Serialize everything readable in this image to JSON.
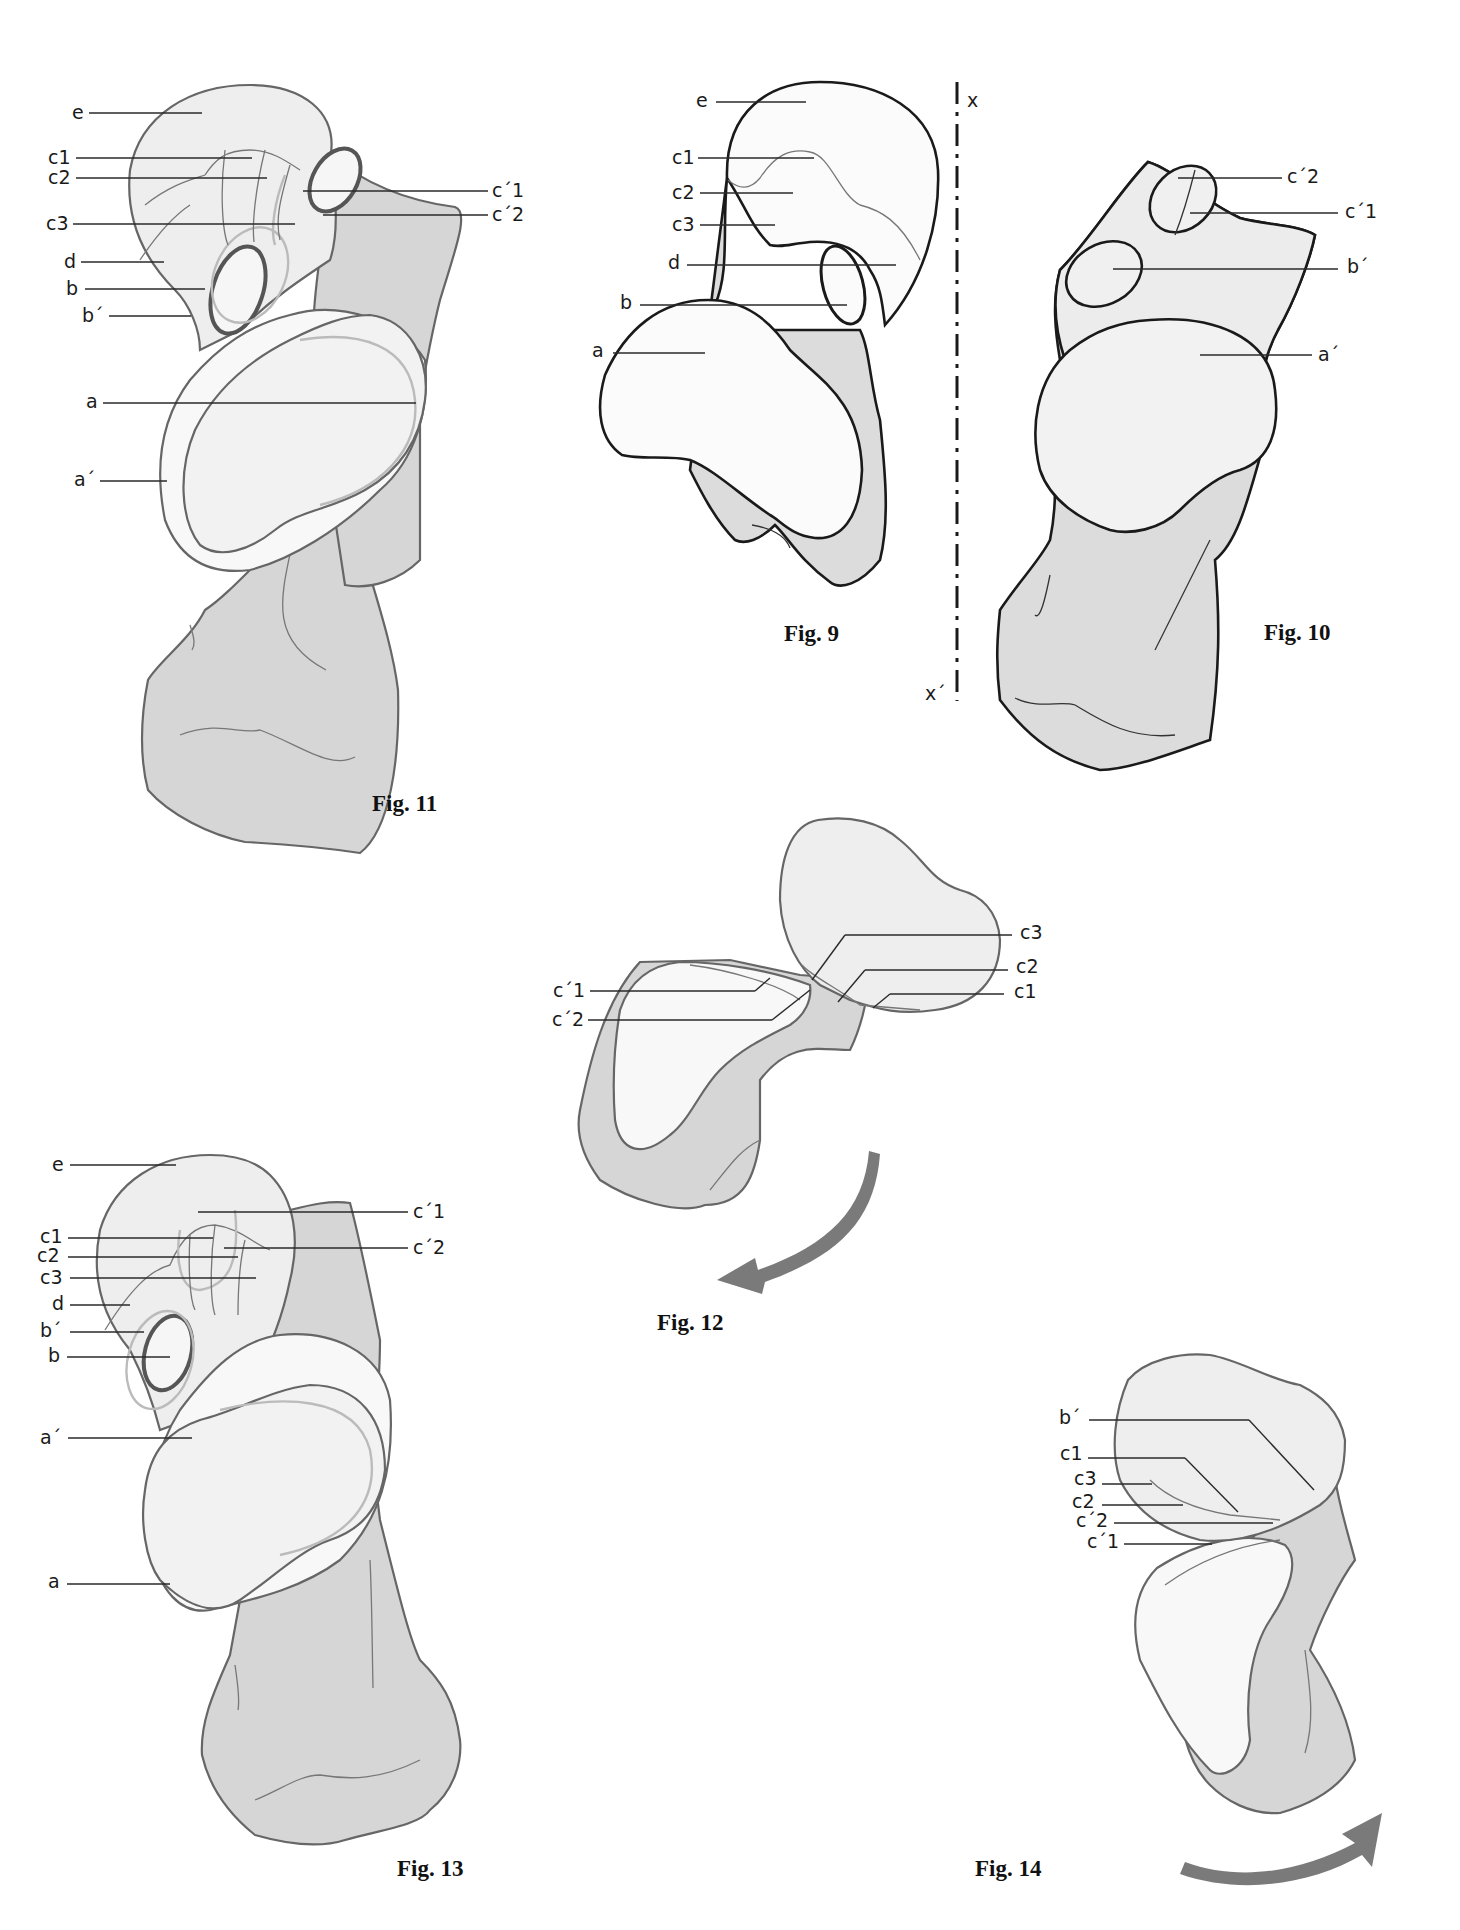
{
  "figures": {
    "fig9": {
      "caption": "Fig. 9",
      "labels": {
        "e": "e",
        "c1": "c1",
        "c2": "c2",
        "c3": "c3",
        "d": "d",
        "b": "b",
        "a": "a"
      },
      "axis": {
        "top": "x",
        "bottom": "x´"
      }
    },
    "fig10": {
      "caption": "Fig. 10",
      "labels": {
        "c2p": "c´2",
        "c1p": "c´1",
        "bp": "b´",
        "ap": "a´"
      }
    },
    "fig11": {
      "caption": "Fig. 11",
      "labels": {
        "e": "e",
        "c1": "c1",
        "c2": "c2",
        "c3": "c3",
        "d": "d",
        "b": "b",
        "bp": "b´",
        "a": "a",
        "ap": "a´",
        "c1p": "c´1",
        "c2p": "c´2"
      }
    },
    "fig12": {
      "caption": "Fig. 12",
      "labels": {
        "c1p": "c´1",
        "c2p": "c´2",
        "c3": "c3",
        "c2": "c2",
        "c1": "c1"
      },
      "arrow": "rotation-arrow-counterclockwise"
    },
    "fig13": {
      "caption": "Fig. 13",
      "labels": {
        "e": "e",
        "c1p": "c´1",
        "c1": "c1",
        "c2p": "c´2",
        "c2": "c2",
        "c3": "c3",
        "d": "d",
        "bp": "b´",
        "b": "b",
        "ap": "a´",
        "a": "a"
      }
    },
    "fig14": {
      "caption": "Fig. 14",
      "labels": {
        "bp": "b´",
        "c1": "c1",
        "c3": "c3",
        "c2": "c2",
        "c2p": "c´2",
        "c1p": "c´1"
      },
      "arrow": "rotation-arrow-clockwise"
    }
  },
  "colors": {
    "bone_fill_gray": "#d6d6d6",
    "bone_fill_light": "#eeeeee",
    "outline_gray": "#666666",
    "outline_black": "#1a1a1a",
    "arrow": "#7a7a7a"
  }
}
